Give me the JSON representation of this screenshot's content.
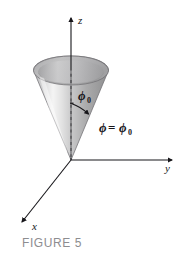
{
  "figure": {
    "caption": "FIGURE 5",
    "caption_color": "#8d8d90",
    "background_color": "#ffffff"
  },
  "axes": {
    "z_label": "z",
    "y_label": "y",
    "x_label": "x",
    "axis_color": "#17161a"
  },
  "annotations": {
    "angle_symbol": "ϕ",
    "angle_subscript": "0",
    "equation_phi": "ϕ",
    "equation_equals": "=",
    "equation_phi_sub": "ϕ",
    "equation_subscript": "0",
    "equation_full": "ϕ = ϕ₀",
    "angle_full": "ϕ₀"
  },
  "surface": {
    "name": "cone",
    "outline_color": "#5d5c60",
    "fill_light": "#f2f2f2",
    "fill_mid": "#c9c9c9",
    "fill_dark": "#8e8e90",
    "rim_inner_color": "#b6b6b8",
    "dashed_axis_color": "#9a9a9c"
  }
}
